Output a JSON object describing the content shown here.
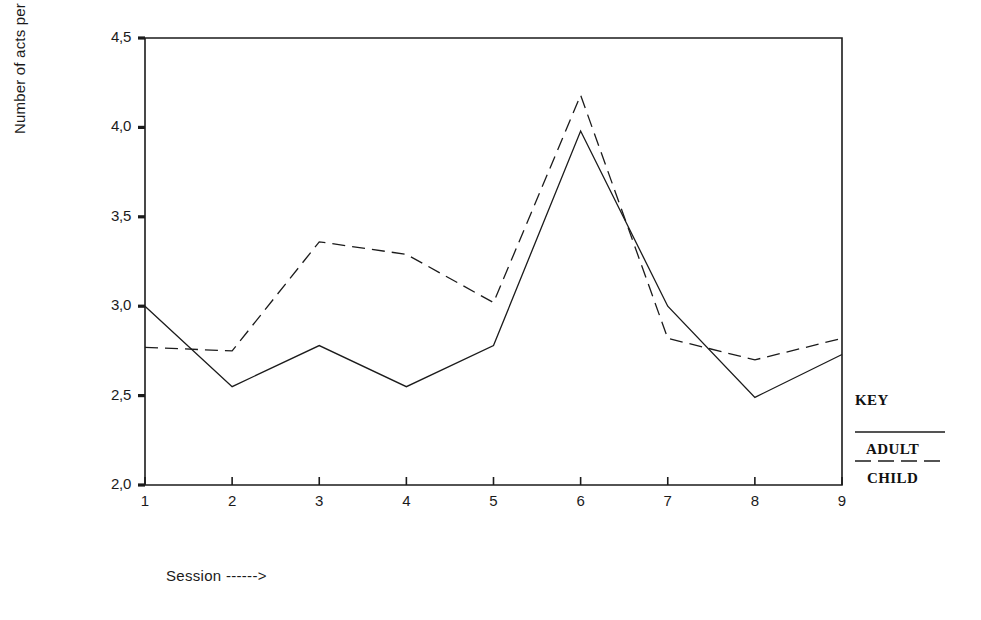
{
  "chart_data": {
    "type": "line",
    "title": "",
    "xlabel": "Session ------>",
    "ylabel": "Number of acts per theme",
    "x": [
      1,
      2,
      3,
      4,
      5,
      6,
      7,
      8,
      9
    ],
    "categories": [
      "1",
      "2",
      "3",
      "4",
      "5",
      "6",
      "7",
      "8",
      "9"
    ],
    "xlim": [
      1,
      9
    ],
    "ylim": [
      2.0,
      4.5
    ],
    "ytick_labels": [
      "2,0",
      "2,5",
      "3,0",
      "3,5",
      "4,0",
      "4,5"
    ],
    "ytick_values": [
      2.0,
      2.5,
      3.0,
      3.5,
      4.0,
      4.5
    ],
    "grid": false,
    "legend_position": "right-bottom-outside",
    "series": [
      {
        "name": "ADULT",
        "style": "solid",
        "color": "#1b1b1b",
        "values": [
          3.0,
          2.55,
          2.78,
          2.55,
          2.78,
          3.98,
          3.0,
          2.49,
          2.73
        ]
      },
      {
        "name": "CHILD",
        "style": "dashed",
        "color": "#1b1b1b",
        "values": [
          2.77,
          2.75,
          3.36,
          3.29,
          3.02,
          4.18,
          2.82,
          2.7,
          2.82
        ]
      }
    ]
  },
  "legend": {
    "title": "KEY",
    "entries": [
      {
        "label": "ADULT",
        "style": "solid"
      },
      {
        "label": "CHILD",
        "style": "dashed"
      }
    ]
  },
  "colors": {
    "ink": "#1b1b1b",
    "background": "#ffffff"
  }
}
